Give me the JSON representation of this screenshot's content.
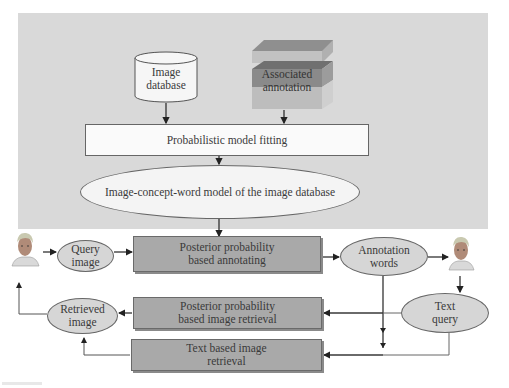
{
  "diagram": {
    "nodes": {
      "image_database": {
        "label_line1": "Image",
        "label_line2": "database",
        "shape": "cylinder"
      },
      "associated_annotation": {
        "label_line1": "Associated",
        "label_line2": "annotation",
        "shape": "3d-stacked-box"
      },
      "probabilistic_model_fitting": {
        "label": "Probabilistic model fitting",
        "shape": "rectangle"
      },
      "image_concept_word_model": {
        "label": "Image-concept-word model of the image database",
        "shape": "ellipse"
      },
      "query_image": {
        "label_line1": "Query",
        "label_line2": "image",
        "shape": "ellipse"
      },
      "posterior_annotating": {
        "label_line1": "Posterior probability",
        "label_line2": "based annotating",
        "shape": "rectangle"
      },
      "annotation_words": {
        "label_line1": "Annotation",
        "label_line2": "words",
        "shape": "ellipse"
      },
      "text_query": {
        "label_line1": "Text",
        "label_line2": "query",
        "shape": "ellipse"
      },
      "posterior_retrieval": {
        "label_line1": "Posterior probability",
        "label_line2": "based image retrieval",
        "shape": "rectangle"
      },
      "retrieved_image": {
        "label_line1": "Retrieved",
        "label_line2": "image",
        "shape": "ellipse"
      },
      "text_based_retrieval": {
        "label_line1": "Text based image",
        "label_line2": "retrieval",
        "shape": "rectangle"
      },
      "user_left": {
        "icon": "user-face-icon"
      },
      "user_right": {
        "icon": "user-face-icon"
      }
    },
    "edges": [
      [
        "image_database",
        "probabilistic_model_fitting"
      ],
      [
        "associated_annotation",
        "probabilistic_model_fitting"
      ],
      [
        "probabilistic_model_fitting",
        "image_concept_word_model"
      ],
      [
        "image_concept_word_model",
        "posterior_annotating"
      ],
      [
        "user_left",
        "query_image"
      ],
      [
        "query_image",
        "posterior_annotating"
      ],
      [
        "posterior_annotating",
        "annotation_words"
      ],
      [
        "annotation_words",
        "user_right"
      ],
      [
        "annotation_words",
        "posterior_retrieval"
      ],
      [
        "annotation_words",
        "text_based_retrieval"
      ],
      [
        "user_right",
        "text_query"
      ],
      [
        "text_query",
        "posterior_retrieval"
      ],
      [
        "text_query",
        "text_based_retrieval"
      ],
      [
        "posterior_retrieval",
        "retrieved_image"
      ],
      [
        "text_based_retrieval",
        "retrieved_image"
      ],
      [
        "retrieved_image",
        "user_left"
      ]
    ],
    "colors": {
      "panel": "#d9d9d9",
      "gray_box": "#a9a9a9",
      "ellipse_fill": "#d6d6d6",
      "white_box": "#fafafa",
      "line": "#222222"
    }
  }
}
